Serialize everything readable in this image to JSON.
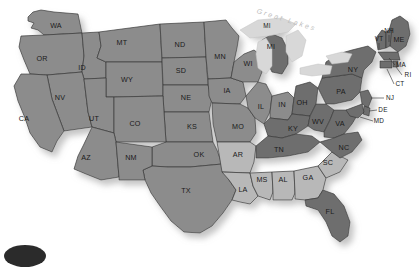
{
  "map": {
    "title": "United States Choropleth Map",
    "background_color": "#ffffff",
    "border_color": "#3a3a3a",
    "shadow_color": "#cfcfcf",
    "shades": {
      "base": "#8c8c8c",
      "light": "#b8b8b8",
      "dark": "#6e6e6e"
    },
    "lake_color": "#d8d8d8",
    "annotations": [
      {
        "name": "great-lakes-label",
        "text": "Great Lakes",
        "color": "#bdbdbd",
        "style": "italic letter-spaced",
        "x": 286,
        "y": 22,
        "rotation": 17
      }
    ],
    "corner_mark": {
      "name": "corner-ellipse",
      "color": "#2b2b2b"
    },
    "states": [
      {
        "code": "WA",
        "name": "Washington",
        "shade": "base",
        "lx": 56,
        "ly": 26
      },
      {
        "code": "OR",
        "name": "Oregon",
        "shade": "base",
        "lx": 42,
        "ly": 59
      },
      {
        "code": "ID",
        "name": "Idaho",
        "shade": "base",
        "lx": 82,
        "ly": 68
      },
      {
        "code": "MT",
        "name": "Montana",
        "shade": "base",
        "lx": 122,
        "ly": 43
      },
      {
        "code": "WY",
        "name": "Wyoming",
        "shade": "base",
        "lx": 127,
        "ly": 80
      },
      {
        "code": "ND",
        "name": "North Dakota",
        "shade": "base",
        "lx": 180,
        "ly": 45
      },
      {
        "code": "SD",
        "name": "South Dakota",
        "shade": "base",
        "lx": 181,
        "ly": 71
      },
      {
        "code": "NE",
        "name": "Nebraska",
        "shade": "base",
        "lx": 186,
        "ly": 98
      },
      {
        "code": "KS",
        "name": "Kansas",
        "shade": "base",
        "lx": 192,
        "ly": 127
      },
      {
        "code": "OK",
        "name": "Oklahoma",
        "shade": "base",
        "lx": 199,
        "ly": 155
      },
      {
        "code": "TX",
        "name": "Texas",
        "shade": "base",
        "lx": 186,
        "ly": 191
      },
      {
        "code": "NV",
        "name": "Nevada",
        "shade": "base",
        "lx": 60,
        "ly": 98
      },
      {
        "code": "CA",
        "name": "California",
        "shade": "base",
        "lx": 24,
        "ly": 119
      },
      {
        "code": "UT",
        "name": "Utah",
        "shade": "base",
        "lx": 94,
        "ly": 119
      },
      {
        "code": "CO",
        "name": "Colorado",
        "shade": "base",
        "lx": 135,
        "ly": 124
      },
      {
        "code": "AZ",
        "name": "Arizona",
        "shade": "base",
        "lx": 86,
        "ly": 158
      },
      {
        "code": "NM",
        "name": "New Mexico",
        "shade": "base",
        "lx": 131,
        "ly": 158
      },
      {
        "code": "MN",
        "name": "Minnesota",
        "shade": "base",
        "lx": 220,
        "ly": 57
      },
      {
        "code": "IA",
        "name": "Iowa",
        "shade": "base",
        "lx": 227,
        "ly": 91
      },
      {
        "code": "MO",
        "name": "Missouri",
        "shade": "base",
        "lx": 238,
        "ly": 127
      },
      {
        "code": "AR",
        "name": "Arkansas",
        "shade": "light",
        "lx": 238,
        "ly": 155
      },
      {
        "code": "LA",
        "name": "Louisiana",
        "shade": "light",
        "lx": 243,
        "ly": 190
      },
      {
        "code": "MS",
        "name": "Mississippi",
        "shade": "light",
        "lx": 262,
        "ly": 180
      },
      {
        "code": "AL",
        "name": "Alabama",
        "shade": "light",
        "lx": 283,
        "ly": 180
      },
      {
        "code": "GA",
        "name": "Georgia",
        "shade": "light",
        "lx": 308,
        "ly": 178
      },
      {
        "code": "SC",
        "name": "South Carolina",
        "shade": "light",
        "lx": 328,
        "ly": 163
      },
      {
        "code": "WI",
        "name": "Wisconsin",
        "shade": "base",
        "lx": 248,
        "ly": 64
      },
      {
        "code": "IL",
        "name": "Illinois",
        "shade": "base",
        "lx": 261,
        "ly": 107
      },
      {
        "code": "IN",
        "name": "Indiana",
        "shade": "base",
        "lx": 282,
        "ly": 105
      },
      {
        "code": "MI",
        "name": "Michigan",
        "shade": "dark",
        "lx": 271,
        "ly": 47
      },
      {
        "code": "MI2",
        "name": "Michigan UP",
        "shade": "dark",
        "lx": 267,
        "ly": 26
      },
      {
        "code": "OH",
        "name": "Ohio",
        "shade": "dark",
        "lx": 302,
        "ly": 103
      },
      {
        "code": "KY",
        "name": "Kentucky",
        "shade": "dark",
        "lx": 293,
        "ly": 129
      },
      {
        "code": "TN",
        "name": "Tennessee",
        "shade": "dark",
        "lx": 279,
        "ly": 150
      },
      {
        "code": "WV",
        "name": "West Virginia",
        "shade": "dark",
        "lx": 318,
        "ly": 122
      },
      {
        "code": "VA",
        "name": "Virginia",
        "shade": "dark",
        "lx": 340,
        "ly": 124
      },
      {
        "code": "NC",
        "name": "North Carolina",
        "shade": "dark",
        "lx": 344,
        "ly": 148
      },
      {
        "code": "FL",
        "name": "Florida",
        "shade": "dark",
        "lx": 330,
        "ly": 212
      },
      {
        "code": "PA",
        "name": "Pennsylvania",
        "shade": "dark",
        "lx": 341,
        "ly": 92
      },
      {
        "code": "NY",
        "name": "New York",
        "shade": "dark",
        "lx": 353,
        "ly": 70
      },
      {
        "code": "ME",
        "name": "Maine",
        "shade": "dark",
        "lx": 399,
        "ly": 40
      },
      {
        "code": "VT",
        "name": "Vermont",
        "shade": "dark",
        "lx": 379,
        "ly": 39
      },
      {
        "code": "NH",
        "name": "New Hampshire",
        "shade": "dark",
        "lx": 389,
        "ly": 31
      },
      {
        "code": "MA",
        "name": "Massachusetts",
        "shade": "dark",
        "lx": 401,
        "ly": 65
      },
      {
        "code": "RI",
        "name": "Rhode Island",
        "shade": "dark",
        "lx": 408,
        "ly": 75
      },
      {
        "code": "CT",
        "name": "Connecticut",
        "shade": "dark",
        "lx": 400,
        "ly": 84
      },
      {
        "code": "NJ",
        "name": "New Jersey",
        "shade": "dark",
        "lx": 390,
        "ly": 98
      },
      {
        "code": "DE",
        "name": "Delaware",
        "shade": "dark",
        "lx": 383,
        "ly": 110
      },
      {
        "code": "MD",
        "name": "Maryland",
        "shade": "dark",
        "lx": 379,
        "ly": 121
      }
    ]
  }
}
